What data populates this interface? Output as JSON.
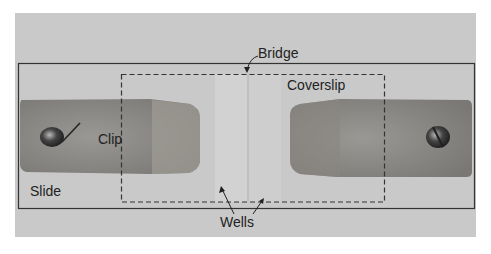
{
  "figure": {
    "labels": {
      "bridge": "Bridge",
      "coverslip": "Coverslip",
      "clip": "Clip",
      "slide": "Slide",
      "wells": "Wells"
    },
    "colors": {
      "background": "#c9c9c9",
      "clip": "#8a8a86",
      "outline": "#333333",
      "text": "#222222"
    }
  }
}
